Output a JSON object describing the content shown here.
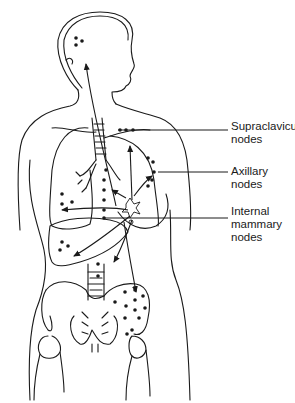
{
  "figure": {
    "stroke_color": "#1a1a1a",
    "background": "#ffffff"
  },
  "labels": {
    "supraclavicular": "Supraclavicular\nnodes",
    "axillary": "Axillary\nnodes",
    "internal_mammary": "Internal\nmammary\nnodes"
  },
  "metastatic_sites": [
    {
      "name": "brain",
      "dots": 3
    },
    {
      "name": "supraclavicular-nodes",
      "dots": 3
    },
    {
      "name": "axillary-nodes",
      "dots": 5
    },
    {
      "name": "internal-mammary-nodes",
      "dots": 5
    },
    {
      "name": "lung",
      "dots": 3
    },
    {
      "name": "liver",
      "dots": 3
    },
    {
      "name": "spine",
      "dots": 2
    },
    {
      "name": "pelvis",
      "dots": 14
    }
  ]
}
